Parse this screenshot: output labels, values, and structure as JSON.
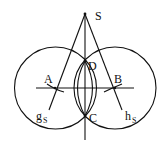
{
  "diagram": {
    "labels": {
      "S": "S",
      "D": "D",
      "A": "A",
      "B": "B",
      "C": "C",
      "g": "g",
      "g_sub": "S",
      "h": "h",
      "h_sub": "S"
    },
    "stroke_color": "#111111"
  }
}
